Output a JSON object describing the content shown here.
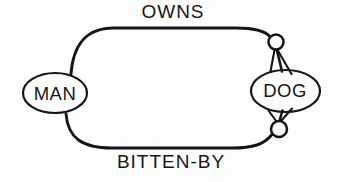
{
  "diagram": {
    "type": "semantic-network",
    "nodes": [
      {
        "id": "man",
        "label": "MAN",
        "shape": "ellipse"
      },
      {
        "id": "dog",
        "label": "DOG",
        "shape": "ellipse"
      }
    ],
    "edges": [
      {
        "label": "OWNS",
        "connects": [
          "MAN",
          "DOG"
        ],
        "label_position": "top",
        "endpoint_marker": "small-circle",
        "arrowhead": "double-line"
      },
      {
        "label": "BITTEN-BY",
        "connects": [
          "MAN",
          "DOG"
        ],
        "label_position": "bottom",
        "endpoint_marker": "small-circle",
        "arrowhead": "double-line"
      }
    ],
    "colors": {
      "ink": "#161616",
      "background": "#fdfdfd"
    }
  }
}
